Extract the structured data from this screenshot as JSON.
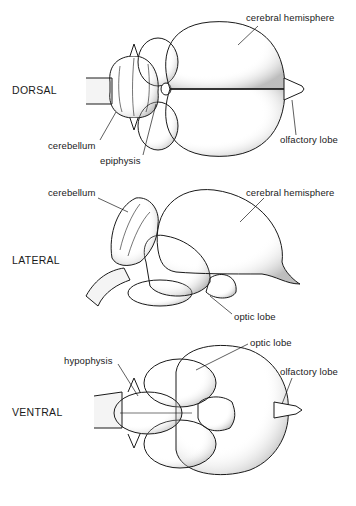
{
  "figure": {
    "views": [
      {
        "name": "DORSAL",
        "labels": [
          "cerebral hemisphere",
          "cerebellum",
          "epiphysis",
          "olfactory lobe"
        ]
      },
      {
        "name": "LATERAL",
        "labels": [
          "cerebellum",
          "cerebral hemisphere",
          "optic lobe"
        ]
      },
      {
        "name": "VENTRAL",
        "labels": [
          "hypophysis",
          "optic lobe",
          "olfactory lobe"
        ]
      }
    ]
  },
  "colors": {
    "ink": "#1a1a1a",
    "background": "#ffffff"
  }
}
